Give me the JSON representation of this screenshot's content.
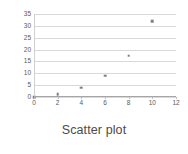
{
  "chart_data": {
    "type": "scatter",
    "title": "Scatter plot",
    "xlabel": "",
    "ylabel": "",
    "xlim": [
      0,
      12
    ],
    "ylim": [
      0,
      35
    ],
    "xticks": [
      0,
      2,
      4,
      6,
      8,
      10,
      12
    ],
    "yticks": [
      0,
      5,
      10,
      15,
      20,
      25,
      30,
      35
    ],
    "grid": "horizontal",
    "legend": "none",
    "series": [
      {
        "name": "Series 1",
        "marker": "square",
        "color": "#7f7f7f",
        "points": [
          {
            "x": 0,
            "y": 0
          },
          {
            "x": 2,
            "y": 1.3
          },
          {
            "x": 4,
            "y": 4
          },
          {
            "x": 6,
            "y": 9
          },
          {
            "x": 8,
            "y": 17.5
          },
          {
            "x": 10,
            "y": 32
          }
        ]
      }
    ]
  },
  "style": {
    "background": "#ffffff",
    "gridline_color": "#d9d9d9",
    "axis_color": "#a6a6a6",
    "tick_text_color": "#595959",
    "title_color": "#4a4a4a",
    "marker_color": "#7f7f7f"
  }
}
